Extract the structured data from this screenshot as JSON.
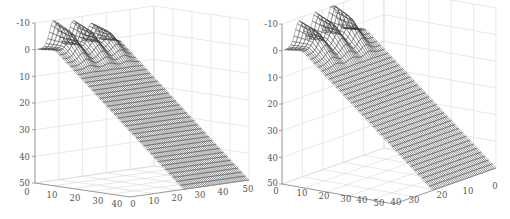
{
  "figure": {
    "width": 510,
    "height": 219,
    "background": "#ffffff",
    "mesh_color": "#3a3a3a",
    "grid_color": "#d8d8d8",
    "axis_color": "#888888",
    "tick_color": "#555555"
  },
  "chart_data": [
    {
      "type": "surface",
      "title": "",
      "style": "mesh wireframe",
      "zlabel": "",
      "xlabel": "",
      "ylabel": "",
      "z_ticks": [
        -10,
        0,
        10,
        20,
        30,
        40,
        50
      ],
      "z_direction": "reversed",
      "zlim": [
        -10,
        50
      ],
      "x_ticks": [
        0,
        10,
        20,
        30,
        40
      ],
      "y_ticks": [
        0,
        10,
        20,
        30,
        40,
        50
      ],
      "xlim": [
        0,
        40
      ],
      "ylim": [
        0,
        50
      ],
      "grid": true,
      "description": "Sloped plane rising from z=50 (front) to z≈0 with three bumps (peaks near z=-10) along the back edge",
      "peaks": [
        {
          "x": 10,
          "z": -10
        },
        {
          "x": 22,
          "z": -9
        },
        {
          "x": 33,
          "z": -7
        }
      ]
    },
    {
      "type": "surface",
      "title": "",
      "style": "mesh wireframe",
      "zlabel": "",
      "xlabel": "",
      "ylabel": "",
      "z_ticks": [
        -10,
        0,
        10,
        20,
        30,
        40,
        50
      ],
      "z_direction": "reversed",
      "zlim": [
        -10,
        50
      ],
      "x_ticks": [
        0,
        10,
        20,
        30,
        40,
        50
      ],
      "y_ticks": [
        40,
        30,
        20,
        10,
        0
      ],
      "xlim": [
        0,
        50
      ],
      "ylim": [
        40,
        0
      ],
      "grid": true,
      "description": "Same surface viewed from a rotated azimuth; three bumps along back edge",
      "peaks": [
        {
          "x": 12,
          "z": -9
        },
        {
          "x": 25,
          "z": -10
        },
        {
          "x": 38,
          "z": -11
        }
      ]
    }
  ],
  "panels": [
    {
      "z_axis": {
        "x": 35,
        "y_top": 23,
        "y_bottom": 183
      },
      "z_labels": [
        "-10",
        "0",
        "10",
        "20",
        "30",
        "40",
        "50"
      ],
      "left_axis_labels": [
        "0",
        "10",
        "20",
        "30",
        "40"
      ],
      "right_axis_labels": [
        "0",
        "10",
        "20",
        "30",
        "40",
        "50"
      ]
    },
    {
      "z_axis": {
        "x": 282,
        "y_top": 24,
        "y_bottom": 184
      },
      "z_labels": [
        "-10",
        "0",
        "10",
        "20",
        "30",
        "40",
        "50"
      ],
      "left_axis_labels": [
        "0",
        "10",
        "20",
        "30",
        "40",
        "50"
      ],
      "right_axis_labels": [
        "40",
        "30",
        "20",
        "10",
        "0"
      ]
    }
  ]
}
